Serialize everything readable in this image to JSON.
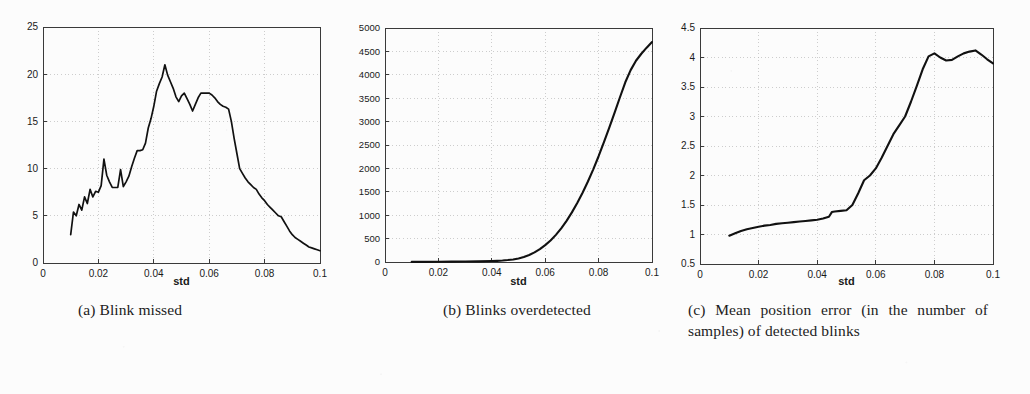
{
  "figure": {
    "background_color": "#fcfcfc",
    "line_color": "#111111",
    "axis_color": "#3a3a3a",
    "grid_color": "#b9b9b9"
  },
  "captions": {
    "a": "(a)  Blink missed",
    "b": "(b)  Blinks overdetected",
    "c": "(c)  Mean position error (in the number of samples) of detected blinks"
  },
  "chart_data": [
    {
      "id": "a",
      "type": "line",
      "title": "Blink missed",
      "xlabel": "std",
      "ylabel": "",
      "xlim": [
        0,
        0.1
      ],
      "ylim": [
        0,
        25
      ],
      "xticks": [
        0,
        0.02,
        0.04,
        0.06,
        0.08,
        0.1
      ],
      "xticklabels": [
        "0",
        "0.02",
        "0.04",
        "0.06",
        "0.08",
        "0.1"
      ],
      "yticks": [
        0,
        5,
        10,
        15,
        20,
        25
      ],
      "yticklabels": [
        "0",
        "5",
        "10",
        "15",
        "20",
        "25"
      ],
      "grid": true,
      "legend": null,
      "x": [
        0.01,
        0.011,
        0.012,
        0.013,
        0.014,
        0.015,
        0.016,
        0.017,
        0.018,
        0.019,
        0.02,
        0.021,
        0.022,
        0.023,
        0.024,
        0.025,
        0.026,
        0.027,
        0.028,
        0.029,
        0.03,
        0.031,
        0.032,
        0.033,
        0.034,
        0.035,
        0.036,
        0.037,
        0.038,
        0.039,
        0.04,
        0.041,
        0.042,
        0.043,
        0.044,
        0.045,
        0.046,
        0.047,
        0.048,
        0.049,
        0.05,
        0.051,
        0.052,
        0.053,
        0.054,
        0.055,
        0.056,
        0.057,
        0.058,
        0.059,
        0.06,
        0.061,
        0.062,
        0.063,
        0.064,
        0.065,
        0.066,
        0.067,
        0.068,
        0.069,
        0.07,
        0.071,
        0.072,
        0.073,
        0.074,
        0.075,
        0.076,
        0.077,
        0.078,
        0.079,
        0.08,
        0.081,
        0.082,
        0.083,
        0.084,
        0.085,
        0.086,
        0.087,
        0.088,
        0.089,
        0.09,
        0.091,
        0.092,
        0.093,
        0.094,
        0.095,
        0.096,
        0.097,
        0.098,
        0.099,
        0.1
      ],
      "y": [
        3.0,
        5.4,
        5.0,
        6.2,
        5.6,
        7.0,
        6.3,
        7.8,
        7.0,
        7.6,
        7.5,
        8.2,
        11.0,
        9.3,
        8.6,
        8.0,
        8.0,
        8.0,
        9.9,
        8.1,
        8.6,
        9.2,
        10.2,
        11.1,
        11.9,
        11.9,
        12.0,
        12.7,
        14.3,
        15.3,
        16.6,
        18.2,
        19.0,
        19.7,
        21.0,
        19.9,
        19.2,
        18.5,
        17.6,
        17.1,
        17.7,
        18.0,
        17.4,
        16.8,
        16.1,
        16.8,
        17.5,
        18.0,
        18.0,
        18.0,
        18.0,
        17.8,
        17.5,
        17.1,
        16.8,
        16.6,
        16.5,
        16.3,
        15.0,
        13.2,
        11.6,
        10.0,
        9.5,
        9.0,
        8.6,
        8.3,
        8.0,
        7.8,
        7.3,
        6.9,
        6.6,
        6.2,
        5.9,
        5.6,
        5.3,
        5.0,
        4.9,
        4.4,
        3.9,
        3.4,
        3.0,
        2.7,
        2.5,
        2.3,
        2.1,
        1.9,
        1.7,
        1.6,
        1.5,
        1.4,
        1.3
      ]
    },
    {
      "id": "b",
      "type": "line",
      "title": "Blinks overdetected",
      "xlabel": "std",
      "ylabel": "",
      "xlim": [
        0,
        0.1
      ],
      "ylim": [
        0,
        5000
      ],
      "xticks": [
        0,
        0.02,
        0.04,
        0.06,
        0.08,
        0.1
      ],
      "xticklabels": [
        "0",
        "0.02",
        "0.04",
        "0.06",
        "0.08",
        "0.1"
      ],
      "yticks": [
        0,
        500,
        1000,
        1500,
        2000,
        2500,
        3000,
        3500,
        4000,
        4500,
        5000
      ],
      "yticklabels": [
        "0",
        "500",
        "1000",
        "1500",
        "2000",
        "2500",
        "3000",
        "3500",
        "4000",
        "4500",
        "5000"
      ],
      "grid": true,
      "legend": null,
      "x": [
        0.01,
        0.015,
        0.02,
        0.025,
        0.03,
        0.035,
        0.04,
        0.042,
        0.044,
        0.046,
        0.048,
        0.05,
        0.052,
        0.054,
        0.056,
        0.058,
        0.06,
        0.062,
        0.064,
        0.066,
        0.068,
        0.07,
        0.072,
        0.074,
        0.076,
        0.078,
        0.08,
        0.082,
        0.084,
        0.086,
        0.088,
        0.09,
        0.092,
        0.094,
        0.096,
        0.098,
        0.1
      ],
      "y": [
        2,
        3,
        5,
        7,
        10,
        14,
        20,
        25,
        32,
        42,
        55,
        75,
        105,
        150,
        205,
        275,
        360,
        460,
        580,
        720,
        880,
        1060,
        1260,
        1480,
        1720,
        1980,
        2260,
        2560,
        2870,
        3190,
        3520,
        3840,
        4100,
        4300,
        4450,
        4580,
        4700
      ]
    },
    {
      "id": "c",
      "type": "line",
      "title": "Mean position error (in the number of samples) of detected blinks",
      "xlabel": "std",
      "ylabel": "",
      "xlim": [
        0,
        0.1
      ],
      "ylim": [
        0.5,
        4.5
      ],
      "xticks": [
        0,
        0.02,
        0.04,
        0.06,
        0.08,
        0.1
      ],
      "xticklabels": [
        "0",
        "0.02",
        "0.04",
        "0.06",
        "0.08",
        "0.1"
      ],
      "yticks": [
        0.5,
        1,
        1.5,
        2,
        2.5,
        3,
        3.5,
        4,
        4.5
      ],
      "yticklabels": [
        "0.5",
        "1",
        "1.5",
        "2",
        "2.5",
        "3",
        "3.5",
        "4",
        "4.5"
      ],
      "grid": true,
      "legend": null,
      "x": [
        0.01,
        0.012,
        0.014,
        0.016,
        0.018,
        0.02,
        0.022,
        0.024,
        0.026,
        0.028,
        0.03,
        0.032,
        0.034,
        0.036,
        0.038,
        0.04,
        0.042,
        0.044,
        0.045,
        0.046,
        0.048,
        0.05,
        0.052,
        0.054,
        0.056,
        0.058,
        0.06,
        0.062,
        0.064,
        0.066,
        0.068,
        0.07,
        0.072,
        0.074,
        0.076,
        0.078,
        0.08,
        0.082,
        0.084,
        0.086,
        0.088,
        0.09,
        0.092,
        0.094,
        0.096,
        0.098,
        0.1
      ],
      "y": [
        0.98,
        1.02,
        1.06,
        1.09,
        1.11,
        1.13,
        1.15,
        1.16,
        1.18,
        1.19,
        1.2,
        1.21,
        1.22,
        1.23,
        1.24,
        1.25,
        1.27,
        1.3,
        1.38,
        1.39,
        1.4,
        1.41,
        1.5,
        1.7,
        1.92,
        2.0,
        2.12,
        2.3,
        2.5,
        2.7,
        2.85,
        3.0,
        3.25,
        3.52,
        3.8,
        4.02,
        4.07,
        4.0,
        3.95,
        3.96,
        4.02,
        4.07,
        4.1,
        4.12,
        4.05,
        3.97,
        3.9
      ]
    }
  ]
}
